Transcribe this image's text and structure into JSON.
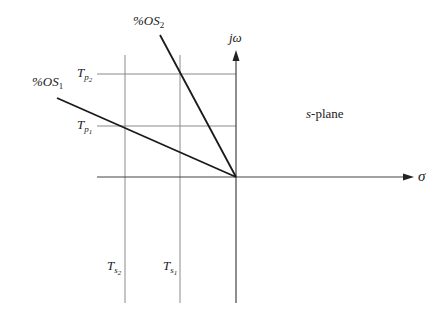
{
  "diagram": {
    "title": "s-plane",
    "axes": {
      "imaginary_label": "jω",
      "real_label": "σ"
    },
    "lines": {
      "os1": {
        "label_prefix": "%OS",
        "label_sub": "1"
      },
      "os2": {
        "label_prefix": "%OS",
        "label_sub": "2"
      }
    },
    "horizontal_guides": [
      {
        "label_main": "T",
        "label_sub": "p",
        "label_subsub": "2"
      },
      {
        "label_main": "T",
        "label_sub": "p",
        "label_subsub": "1"
      }
    ],
    "vertical_guides": [
      {
        "label_main": "T",
        "label_sub": "s",
        "label_subsub": "2"
      },
      {
        "label_main": "T",
        "label_sub": "s",
        "label_subsub": "1"
      }
    ],
    "plane_label_var": "s",
    "plane_label_rest": "-plane",
    "colors": {
      "grid": "#8a8a8a",
      "axis": "#444444",
      "line": "#1a1a1a"
    }
  }
}
